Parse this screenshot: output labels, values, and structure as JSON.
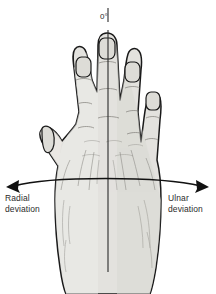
{
  "figure": {
    "background_color": "#ffffff"
  },
  "labels": {
    "zero_degrees": "0°",
    "radial_line1": "Radial",
    "radial_line2": "deviation",
    "ulnar_line1": "Ulnar",
    "ulnar_line2": "deviation"
  },
  "colors": {
    "skin_fill": "#e3e2de",
    "outline": "#1a1a1a",
    "shading": "#b9b8b3",
    "text": "#2b2b2b",
    "arrow": "#111111",
    "axis_line": "#2a2a2a"
  },
  "icons": {
    "left_arrow": "arrow-left-icon",
    "right_arrow": "arrow-right-icon",
    "axis": "vertical-axis-line",
    "hand": "hand-dorsal-view"
  },
  "anatomy": {
    "view": "dorsal",
    "digits": [
      "thumb",
      "index",
      "middle",
      "ring",
      "little"
    ],
    "reference_axis_degrees": 0,
    "motions": [
      "radial deviation",
      "ulnar deviation"
    ]
  }
}
